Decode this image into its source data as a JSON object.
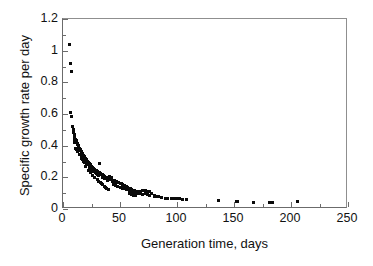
{
  "chart_data": {
    "type": "scatter",
    "title": "",
    "xlabel": "Generation time, days",
    "ylabel": "Specific growth rate per day",
    "xlim": [
      0,
      250
    ],
    "ylim": [
      0,
      1.2
    ],
    "x_ticks": [
      0,
      50,
      100,
      150,
      200,
      250
    ],
    "x_tick_labels": [
      "0",
      "50",
      "100",
      "150",
      "200",
      "250"
    ],
    "x_minor_ticks": [
      25,
      75,
      125,
      175,
      225
    ],
    "y_ticks": [
      0,
      0.2,
      0.4,
      0.6,
      0.8,
      1,
      1.2
    ],
    "y_tick_labels": [
      "0",
      "0.2",
      "0.4",
      "0.6",
      "0.8",
      "1",
      "1.2"
    ],
    "y_minor_ticks": [
      0.1,
      0.3,
      0.5,
      0.7,
      0.9,
      1.1
    ],
    "grid": false,
    "legend": false,
    "marker": "square",
    "marker_color": "#0a0a0a",
    "marker_size_px": 3,
    "series": [
      {
        "name": "Specific growth rate vs generation time",
        "points": [
          [
            5.5,
            1.04
          ],
          [
            7.0,
            0.92
          ],
          [
            7.5,
            0.87
          ],
          [
            6.5,
            0.61
          ],
          [
            7.2,
            0.585
          ],
          [
            8.5,
            0.52
          ],
          [
            9.0,
            0.5
          ],
          [
            9.5,
            0.485
          ],
          [
            10.0,
            0.47
          ],
          [
            10.5,
            0.455
          ],
          [
            11.0,
            0.44
          ],
          [
            11.5,
            0.43
          ],
          [
            12.0,
            0.425
          ],
          [
            12.3,
            0.415
          ],
          [
            12.8,
            0.41
          ],
          [
            13.0,
            0.405
          ],
          [
            13.5,
            0.4
          ],
          [
            14.0,
            0.395
          ],
          [
            11.0,
            0.385
          ],
          [
            14.5,
            0.382
          ],
          [
            15.0,
            0.375
          ],
          [
            15.5,
            0.37
          ],
          [
            16.0,
            0.365
          ],
          [
            16.5,
            0.355
          ],
          [
            17.0,
            0.35
          ],
          [
            17.5,
            0.345
          ],
          [
            18.0,
            0.34
          ],
          [
            16.0,
            0.335
          ],
          [
            18.5,
            0.33
          ],
          [
            19.0,
            0.325
          ],
          [
            19.5,
            0.32
          ],
          [
            20.0,
            0.315
          ],
          [
            20.5,
            0.31
          ],
          [
            21.0,
            0.305
          ],
          [
            18.0,
            0.3
          ],
          [
            21.5,
            0.3
          ],
          [
            22.0,
            0.295
          ],
          [
            22.5,
            0.29
          ],
          [
            23.0,
            0.288
          ],
          [
            32.0,
            0.29
          ],
          [
            23.5,
            0.282
          ],
          [
            24.0,
            0.278
          ],
          [
            24.5,
            0.275
          ],
          [
            25.0,
            0.27
          ],
          [
            20.0,
            0.268
          ],
          [
            25.5,
            0.265
          ],
          [
            26.0,
            0.262
          ],
          [
            26.5,
            0.258
          ],
          [
            27.0,
            0.255
          ],
          [
            27.5,
            0.252
          ],
          [
            28.0,
            0.248
          ],
          [
            22.0,
            0.245
          ],
          [
            28.5,
            0.245
          ],
          [
            29.0,
            0.242
          ],
          [
            29.5,
            0.24
          ],
          [
            30.0,
            0.238
          ],
          [
            30.5,
            0.235
          ],
          [
            31.0,
            0.232
          ],
          [
            31.5,
            0.23
          ],
          [
            24.0,
            0.228
          ],
          [
            32.0,
            0.228
          ],
          [
            32.5,
            0.225
          ],
          [
            33.0,
            0.222
          ],
          [
            33.5,
            0.22
          ],
          [
            34.0,
            0.218
          ],
          [
            34.5,
            0.215
          ],
          [
            26.0,
            0.212
          ],
          [
            35.0,
            0.212
          ],
          [
            35.5,
            0.21
          ],
          [
            36.0,
            0.208
          ],
          [
            36.5,
            0.205
          ],
          [
            37.0,
            0.202
          ],
          [
            37.5,
            0.2
          ],
          [
            28.0,
            0.198
          ],
          [
            38.0,
            0.198
          ],
          [
            38.5,
            0.195
          ],
          [
            39.0,
            0.192
          ],
          [
            39.5,
            0.19
          ],
          [
            40.0,
            0.19
          ],
          [
            41.0,
            0.188
          ],
          [
            30.0,
            0.186
          ],
          [
            42.0,
            0.185
          ],
          [
            43.0,
            0.182
          ],
          [
            44.0,
            0.18
          ],
          [
            45.0,
            0.178
          ],
          [
            31.0,
            0.175
          ],
          [
            46.0,
            0.175
          ],
          [
            47.0,
            0.172
          ],
          [
            41.0,
            0.205
          ],
          [
            42.5,
            0.2
          ],
          [
            48.0,
            0.17
          ],
          [
            33.0,
            0.168
          ],
          [
            49.0,
            0.165
          ],
          [
            50.0,
            0.162
          ],
          [
            34.0,
            0.16
          ],
          [
            51.0,
            0.158
          ],
          [
            52.0,
            0.155
          ],
          [
            35.0,
            0.152
          ],
          [
            53.0,
            0.15
          ],
          [
            54.0,
            0.148
          ],
          [
            36.0,
            0.145
          ],
          [
            55.0,
            0.142
          ],
          [
            56.0,
            0.14
          ],
          [
            37.0,
            0.138
          ],
          [
            57.0,
            0.135
          ],
          [
            58.0,
            0.132
          ],
          [
            38.5,
            0.13
          ],
          [
            59.0,
            0.128
          ],
          [
            60.0,
            0.125
          ],
          [
            40.0,
            0.122
          ],
          [
            61.0,
            0.12
          ],
          [
            62.0,
            0.118
          ],
          [
            63.0,
            0.115
          ],
          [
            64.0,
            0.112
          ],
          [
            65.0,
            0.11
          ],
          [
            44.0,
            0.155
          ],
          [
            46.0,
            0.148
          ],
          [
            48.0,
            0.142
          ],
          [
            50.0,
            0.138
          ],
          [
            52.0,
            0.132
          ],
          [
            54.0,
            0.128
          ],
          [
            56.0,
            0.122
          ],
          [
            58.0,
            0.118
          ],
          [
            60.0,
            0.112
          ],
          [
            62.0,
            0.105
          ],
          [
            64.0,
            0.1
          ],
          [
            66.0,
            0.098
          ],
          [
            68.0,
            0.095
          ],
          [
            70.0,
            0.092
          ],
          [
            66.0,
            0.108
          ],
          [
            68.0,
            0.112
          ],
          [
            70.0,
            0.118
          ],
          [
            72.0,
            0.115
          ],
          [
            74.0,
            0.112
          ],
          [
            76.0,
            0.108
          ],
          [
            78.0,
            0.1
          ],
          [
            72.0,
            0.095
          ],
          [
            74.0,
            0.09
          ],
          [
            76.0,
            0.088
          ],
          [
            80.0,
            0.085
          ],
          [
            82.0,
            0.082
          ],
          [
            84.0,
            0.078
          ],
          [
            86.0,
            0.072
          ],
          [
            60.0,
            0.09
          ],
          [
            62.0,
            0.088
          ],
          [
            64.0,
            0.085
          ],
          [
            58.0,
            0.095
          ],
          [
            90.0,
            0.068
          ],
          [
            92.0,
            0.068
          ],
          [
            95.0,
            0.065
          ],
          [
            98.0,
            0.065
          ],
          [
            100.0,
            0.065
          ],
          [
            102.0,
            0.065
          ],
          [
            105.0,
            0.062
          ],
          [
            108.0,
            0.062
          ],
          [
            136.0,
            0.055
          ],
          [
            152.0,
            0.048
          ],
          [
            153.0,
            0.048
          ],
          [
            167.0,
            0.042
          ],
          [
            181.0,
            0.042
          ],
          [
            184.0,
            0.042
          ],
          [
            206.0,
            0.045
          ],
          [
            80.0,
            0.078
          ],
          [
            45.0,
            0.165
          ],
          [
            43.0,
            0.172
          ],
          [
            26.0,
            0.24
          ],
          [
            27.0,
            0.235
          ],
          [
            24.5,
            0.252
          ],
          [
            23.0,
            0.262
          ],
          [
            21.0,
            0.278
          ],
          [
            19.0,
            0.292
          ],
          [
            17.5,
            0.31
          ],
          [
            16.0,
            0.322
          ],
          [
            14.5,
            0.345
          ],
          [
            13.0,
            0.362
          ],
          [
            12.0,
            0.378
          ],
          [
            10.5,
            0.42
          ],
          [
            9.8,
            0.44
          ],
          [
            29.0,
            0.222
          ],
          [
            30.5,
            0.215
          ],
          [
            31.5,
            0.21
          ],
          [
            34.5,
            0.198
          ],
          [
            36.5,
            0.192
          ],
          [
            39.0,
            0.182
          ],
          [
            25.5,
            0.248
          ],
          [
            28.5,
            0.232
          ]
        ]
      }
    ]
  }
}
